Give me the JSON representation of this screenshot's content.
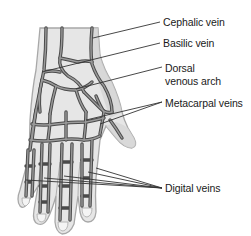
{
  "figure": {
    "colors": {
      "background": "#ffffff",
      "skin_fill": "#e6e6e6",
      "skin_shadow": "#cfcfcf",
      "skin_outline": "#a8a8a8",
      "vein_fill": "#8a8a8a",
      "vein_outline": "#4a4a4a",
      "leader_line": "#333333",
      "label_text": "#1a1a1a"
    },
    "labels": [
      {
        "id": "cephalic",
        "text": "Cephalic vein"
      },
      {
        "id": "basilic",
        "text": "Basilic vein"
      },
      {
        "id": "dorsal_line1",
        "text": "Dorsal"
      },
      {
        "id": "dorsal_line2",
        "text": "venous arch"
      },
      {
        "id": "metacarpal",
        "text": "Metacarpal veins"
      },
      {
        "id": "digital",
        "text": "Digital veins"
      }
    ]
  }
}
